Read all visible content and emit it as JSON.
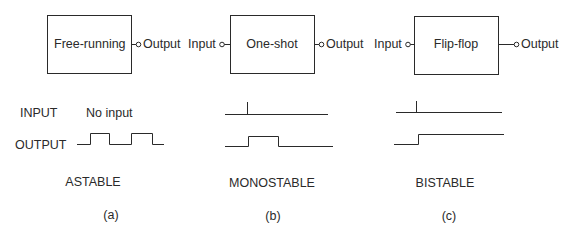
{
  "panels": [
    {
      "id": "a",
      "block_label": "Free-running",
      "input_label": null,
      "output_label": "Output",
      "input_row_label": "INPUT",
      "input_note": "No input",
      "output_row_label": "OUTPUT",
      "mode_label": "ASTABLE",
      "caption": "(a)"
    },
    {
      "id": "b",
      "block_label": "One-shot",
      "input_label": "Input",
      "output_label": "Output",
      "mode_label": "MONOSTABLE",
      "caption": "(b)"
    },
    {
      "id": "c",
      "block_label": "Flip-flop",
      "input_label": "Input",
      "output_label": "Output",
      "mode_label": "BISTABLE",
      "caption": "(c)"
    }
  ],
  "colors": {
    "line": "#2a2a2a",
    "background": "#ffffff"
  }
}
